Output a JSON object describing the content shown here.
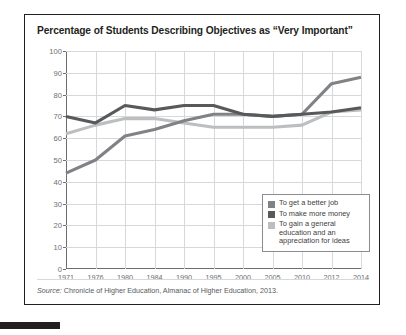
{
  "card": {
    "title": "Percentage of Students Describing Objectives as “Very Important”",
    "source_label": "Source:",
    "source_text": " Chronicle of Higher Education, Almanac of Higher Education, 2013."
  },
  "legend": {
    "position": "inside-lower-right",
    "items": [
      {
        "label": "To get a better job",
        "color": "#808285"
      },
      {
        "label": "To make more money",
        "color": "#58595b"
      },
      {
        "label": "To gain a general education and an appreciation for ideas",
        "color": "#bcbec0"
      }
    ]
  },
  "chart_data": {
    "type": "line",
    "title": "Percentage of Students Describing Objectives as “Very Important”",
    "xlabel": "",
    "ylabel": "",
    "ylim": [
      0,
      100
    ],
    "ytick_step": 10,
    "yticks": [
      0,
      10,
      20,
      30,
      40,
      50,
      60,
      70,
      80,
      90,
      100
    ],
    "grid": true,
    "legend_position": "lower right",
    "categories": [
      "1971",
      "1976",
      "1980",
      "1984",
      "1990",
      "1995",
      "2000",
      "2005",
      "2010",
      "2012",
      "2014"
    ],
    "series": [
      {
        "name": "To get a better job",
        "color": "#808285",
        "values": [
          44,
          50,
          61,
          64,
          68,
          71,
          71,
          70,
          71,
          85,
          88
        ]
      },
      {
        "name": "To make more money",
        "color": "#58595b",
        "values": [
          70,
          67,
          75,
          73,
          75,
          75,
          71,
          70,
          71,
          72,
          74
        ]
      },
      {
        "name": "To gain a general education and an appreciation for ideas",
        "color": "#bcbec0",
        "values": [
          62,
          66,
          69,
          69,
          67,
          65,
          65,
          65,
          66,
          72,
          73
        ]
      }
    ]
  }
}
